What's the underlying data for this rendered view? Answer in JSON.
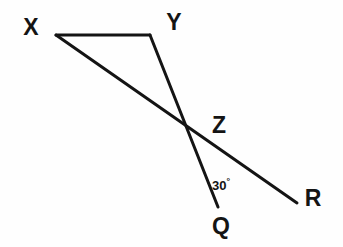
{
  "figure": {
    "background_color": "#fefefe",
    "stroke_color": "#141414",
    "stroke_width": 3,
    "width": 343,
    "height": 247
  },
  "labels": {
    "x": "X",
    "y": "Y",
    "z": "Z",
    "q": "Q",
    "r": "R",
    "angle": "30",
    "degree_symbol": "°"
  },
  "points": {
    "X": {
      "x": 56,
      "y": 35,
      "label_x": 31,
      "label_y": 27
    },
    "Y": {
      "x": 150,
      "y": 35,
      "label_x": 174,
      "label_y": 22
    },
    "Z": {
      "x": 197,
      "y": 132,
      "label_x": 219,
      "label_y": 125
    },
    "Q": {
      "x": 218,
      "y": 207,
      "label_x": 221,
      "label_y": 226
    },
    "R": {
      "x": 297,
      "y": 203,
      "label_x": 313,
      "label_y": 198
    }
  },
  "segments": [
    {
      "name": "segment-XY",
      "from": "X",
      "to": "Y",
      "x1": 56,
      "y1": 35,
      "x2": 150,
      "y2": 35
    },
    {
      "name": "segment-XR",
      "from": "X",
      "to": "R",
      "x1": 56,
      "y1": 35,
      "x2": 297,
      "y2": 203
    },
    {
      "name": "segment-YQ",
      "from": "Y",
      "to": "Q",
      "x1": 150,
      "y1": 35,
      "x2": 218,
      "y2": 207
    }
  ],
  "angle_annotation": {
    "text": "30",
    "unit": "°",
    "vertex": "Z",
    "between": [
      "Z-Q",
      "Z-R"
    ],
    "label_x": 221,
    "label_y": 185
  }
}
